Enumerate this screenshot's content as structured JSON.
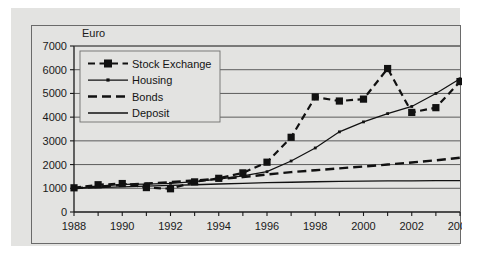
{
  "chart_data": {
    "type": "line",
    "title": "",
    "xlabel": "",
    "ylabel": "Euro",
    "y_unit_label": "Euro",
    "xlim": [
      1988,
      2004
    ],
    "ylim": [
      0,
      7000
    ],
    "grid": true,
    "legend_position": "top-left",
    "x": [
      1988,
      1989,
      1990,
      1991,
      1992,
      1993,
      1994,
      1995,
      1996,
      1997,
      1998,
      1999,
      2000,
      2001,
      2002,
      2003,
      2004
    ],
    "categories": [
      "1988",
      "1989",
      "1990",
      "1991",
      "1992",
      "1993",
      "1994",
      "1995",
      "1996",
      "1997",
      "1998",
      "1999",
      "2000",
      "2001",
      "2002",
      "2003",
      "2004"
    ],
    "xticks": [
      "1988",
      "1990",
      "1992",
      "1994",
      "1996",
      "1998",
      "2000",
      "2002",
      "2004"
    ],
    "yticks": [
      "0",
      "1000",
      "2000",
      "3000",
      "4000",
      "5000",
      "6000",
      "7000"
    ],
    "series": [
      {
        "name": "Stock Exchange",
        "style": "dashed-square-marker",
        "values": [
          1020,
          1150,
          1200,
          1030,
          980,
          1270,
          1420,
          1650,
          2100,
          3150,
          4850,
          4680,
          4760,
          6050,
          4200,
          4400,
          5500
        ]
      },
      {
        "name": "Housing",
        "style": "solid-thin-dot-marker",
        "values": [
          1000,
          1080,
          1160,
          1180,
          1210,
          1280,
          1390,
          1520,
          1700,
          2150,
          2700,
          3380,
          3800,
          4150,
          4450,
          5000,
          5620
        ]
      },
      {
        "name": "Bonds",
        "style": "thick-dashed",
        "values": [
          1000,
          1070,
          1140,
          1200,
          1260,
          1330,
          1400,
          1470,
          1580,
          1680,
          1760,
          1840,
          1920,
          2000,
          2090,
          2180,
          2290
        ]
      },
      {
        "name": "Deposit",
        "style": "solid-thin",
        "values": [
          1000,
          1030,
          1060,
          1090,
          1120,
          1150,
          1180,
          1210,
          1235,
          1255,
          1275,
          1290,
          1300,
          1310,
          1315,
          1320,
          1325
        ]
      }
    ]
  },
  "legend": {
    "items": [
      {
        "label": "Stock Exchange"
      },
      {
        "label": "Housing"
      },
      {
        "label": "Bonds"
      },
      {
        "label": "Deposit"
      }
    ]
  },
  "colors": {
    "ink": "#111111",
    "panel_background": "#e3e3e1",
    "frame_border": "#6a6a6a",
    "gridline": "#4d4d4d",
    "page_background": "#ffffff"
  }
}
